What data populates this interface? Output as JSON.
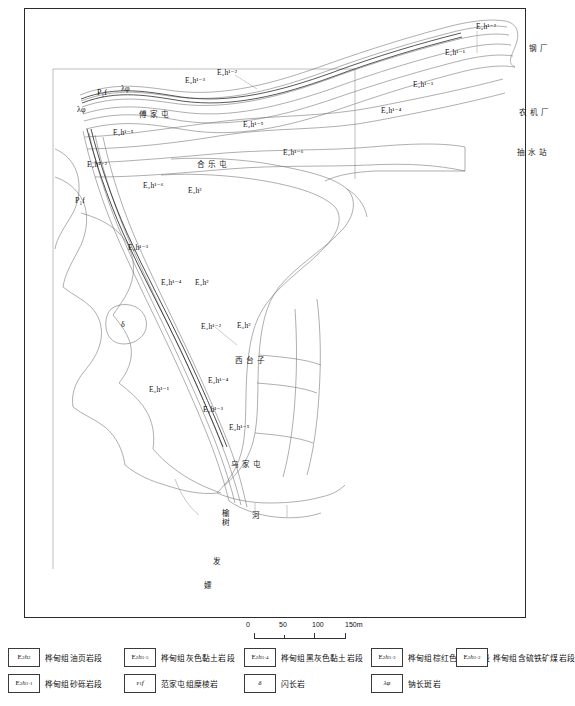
{
  "map": {
    "title": "",
    "unit_labels": [
      {
        "id": "u1",
        "text": "E₂h¹⁻²",
        "x": 451,
        "y": 14
      },
      {
        "id": "u2",
        "text": "E₂h¹⁻¹",
        "x": 420,
        "y": 40
      },
      {
        "id": "u3",
        "text": "E₂h¹⁻²",
        "x": 192,
        "y": 60
      },
      {
        "id": "u4",
        "text": "E₂h¹⁻³",
        "x": 160,
        "y": 68
      },
      {
        "id": "u5",
        "text": "E₂h¹⁻³",
        "x": 388,
        "y": 72
      },
      {
        "id": "u6",
        "text": "E₂h¹⁻⁴",
        "x": 356,
        "y": 98
      },
      {
        "id": "u7",
        "text": "E₂h¹⁻⁵",
        "x": 218,
        "y": 112
      },
      {
        "id": "u8",
        "text": "E₂h¹⁻⁵",
        "x": 88,
        "y": 120
      },
      {
        "id": "u9",
        "text": "E₂h¹⁻⁶",
        "x": 258,
        "y": 140
      },
      {
        "id": "u10",
        "text": "E₂h¹⁻²",
        "x": 62,
        "y": 152
      },
      {
        "id": "u11",
        "text": "E₂h¹⁻⁶",
        "x": 118,
        "y": 173
      },
      {
        "id": "u12",
        "text": "E₂h²",
        "x": 163,
        "y": 178
      },
      {
        "id": "u13",
        "text": "E₂h¹⁻³",
        "x": 103,
        "y": 235
      },
      {
        "id": "u14",
        "text": "E₂h¹⁻⁴",
        "x": 136,
        "y": 270
      },
      {
        "id": "u15",
        "text": "E₂h²",
        "x": 170,
        "y": 270
      },
      {
        "id": "u16",
        "text": "E₂h¹⁻²",
        "x": 176,
        "y": 314
      },
      {
        "id": "u17",
        "text": "E₂h²",
        "x": 212,
        "y": 313
      },
      {
        "id": "u18",
        "text": "E₂h¹⁻⁴",
        "x": 183,
        "y": 368
      },
      {
        "id": "u19",
        "text": "E₂h¹⁻¹",
        "x": 124,
        "y": 377
      },
      {
        "id": "u20",
        "text": "E₂h¹⁻³",
        "x": 178,
        "y": 397
      },
      {
        "id": "u21",
        "text": "E₂h¹⁻⁵",
        "x": 204,
        "y": 415
      }
    ],
    "symbol_labels": [
      {
        "id": "s1",
        "text": "P₁f",
        "x": 72,
        "y": 80
      },
      {
        "id": "s2",
        "text": "P₁f",
        "x": 50,
        "y": 188
      },
      {
        "id": "s3",
        "text": "λφ",
        "x": 96,
        "y": 76
      },
      {
        "id": "s4",
        "text": "λφ",
        "x": 52,
        "y": 97
      },
      {
        "id": "s5",
        "text": "δ",
        "x": 96,
        "y": 312
      }
    ],
    "place_labels": [
      {
        "id": "p1",
        "text": "傅家屯",
        "x": 114,
        "y": 102
      },
      {
        "id": "p2",
        "text": "合乐屯",
        "x": 172,
        "y": 152
      },
      {
        "id": "p3",
        "text": "西台子",
        "x": 210,
        "y": 348
      },
      {
        "id": "p4",
        "text": "乌家屯",
        "x": 206,
        "y": 452
      },
      {
        "id": "p5",
        "text": "钢厂",
        "x": 504,
        "y": 36
      },
      {
        "id": "p6",
        "text": "农机厂",
        "x": 494,
        "y": 100
      },
      {
        "id": "p7",
        "text": "抽水站",
        "x": 492,
        "y": 140
      }
    ],
    "vertical_labels": [
      {
        "id": "v1",
        "text": "榆树",
        "x": 196,
        "y": 500
      },
      {
        "id": "v2",
        "text": "河",
        "x": 226,
        "y": 502
      },
      {
        "id": "v3",
        "text": "发",
        "x": 187,
        "y": 548
      },
      {
        "id": "v4",
        "text": "嫖",
        "x": 178,
        "y": 572
      }
    ]
  },
  "scale": {
    "ticks": [
      {
        "label": "0",
        "pos": 0
      },
      {
        "label": "50",
        "pos": 33
      },
      {
        "label": "100",
        "pos": 66
      },
      {
        "label": "150m",
        "pos": 99
      }
    ]
  },
  "legend": {
    "row1": [
      {
        "id": "l1",
        "symbol_html": "E<sub>2</sub><i>h</i><sup>2</sup>",
        "symbol_text": "E₂h²",
        "label": "桦甸组油页岩段",
        "x": 4
      },
      {
        "id": "l2",
        "symbol_html": "E<sub>2</sub><i>h</i><sup>1-5</sup>",
        "symbol_text": "E₂h¹⁻⁵",
        "label": "桦甸组灰色黏土岩段",
        "x": 120
      },
      {
        "id": "l3",
        "symbol_html": "E<sub>2</sub><i>h</i><sup>1-4</sup>",
        "symbol_text": "E₂h¹⁻⁴",
        "label": "桦甸组黑灰色黏土岩段",
        "x": 240
      },
      {
        "id": "l4",
        "symbol_html": "E<sub>2</sub><i>h</i><sup>1-3</sup>",
        "symbol_text": "E₂h¹⁻³",
        "label": "桦甸组棕红色黏土岩段",
        "x": 367
      },
      {
        "id": "l5",
        "symbol_html": "E<sub>2</sub><i>h</i><sup>1-2</sup>",
        "symbol_text": "E₂h¹⁻²",
        "label": "桦甸组含硫铁矿煤岩段",
        "x": 452
      }
    ],
    "row2": [
      {
        "id": "l6",
        "symbol_html": "E<sub>2</sub><i>h</i><sup>1-1</sup>",
        "symbol_text": "E₂h¹⁻¹",
        "label": "桦甸组砂砾岩段",
        "x": 4
      },
      {
        "id": "l7",
        "symbol_html": "<sup>P</sup><sub>1</sub><i>f</i>",
        "symbol_text": "P₁f",
        "label": "范家屯组糜棱岩",
        "x": 120
      },
      {
        "id": "l8",
        "symbol_html": "<i>δ</i>",
        "symbol_text": "δ",
        "label": "闪长岩",
        "x": 240
      },
      {
        "id": "l9",
        "symbol_html": "<i>λ</i> <i>φ</i>",
        "symbol_text": "λφ",
        "label": "钠长斑岩",
        "x": 367
      }
    ]
  }
}
